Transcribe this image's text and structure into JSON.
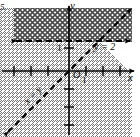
{
  "figure": {
    "item_number": "5.",
    "axes": {
      "y_axis_label": "y",
      "x_axis_label": "x",
      "origin_label": "O",
      "x_unit_tick_label": "1",
      "y_unit_tick_label": "1"
    },
    "lines": [
      {
        "name": "horizontal-boundary",
        "label": "y = 2",
        "style": "dashed",
        "equation_y_value": 2,
        "arrow_ends": "both"
      },
      {
        "name": "diagonal-boundary",
        "label": "x = y",
        "style": "dashed",
        "slope": 1,
        "intercept": 0,
        "arrow_ends": "both"
      }
    ],
    "regions": [
      {
        "name": "region-above-y-equals-2",
        "pattern": "crosshatch",
        "description": "y > 2"
      },
      {
        "name": "region-left-of-x-equals-y",
        "pattern": "diagonal-hatch",
        "description": "x < y"
      }
    ],
    "colors": {
      "ink": "#000000",
      "background": "#ffffff",
      "hatch": "#5a5a5a"
    },
    "axis_ranges": {
      "x": [
        -5,
        5
      ],
      "y": [
        -4,
        5
      ]
    }
  }
}
